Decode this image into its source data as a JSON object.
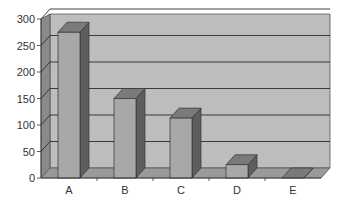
{
  "chart_data": {
    "type": "bar",
    "style": "3d-column",
    "title": "",
    "xlabel": "",
    "ylabel": "",
    "categories": [
      "A",
      "B",
      "C",
      "D",
      "E"
    ],
    "values": [
      275,
      150,
      113,
      25,
      0
    ],
    "ylim": [
      0,
      300
    ],
    "yticks": [
      "0",
      "50",
      "100",
      "150",
      "200",
      "250",
      "300"
    ],
    "grid": true,
    "legend": null,
    "colors": {
      "wall": "#bdbdbd",
      "wall_side": "#8a8a8a",
      "floor": "#9a9a9a",
      "bar_front": "#a8a8a8",
      "bar_side": "#5e5e5e",
      "bar_top": "#7a7a7a",
      "gridline": "#2a2a2a"
    }
  }
}
